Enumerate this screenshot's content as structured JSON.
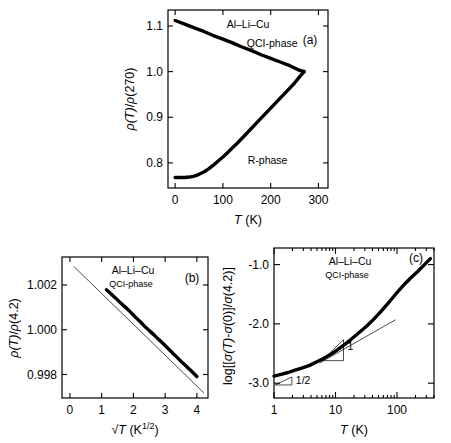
{
  "figure": {
    "name": "resistivity-and-conductivity-of-Al-Li-Cu-quasicrystal",
    "background": "#ffffff",
    "ink_color": "#000000"
  },
  "chart_data": [
    {
      "id": "panel-a",
      "type": "line",
      "panel_label": "(a)",
      "title": "Al–Li–Cu",
      "xlabel": "T (K)",
      "ylabel": "ρ(T)/ρ(270)",
      "xlim": [
        -15,
        320
      ],
      "ylim": [
        0.745,
        1.135
      ],
      "xticks": [
        0,
        100,
        200,
        300
      ],
      "xtick_labels": [
        "0",
        "100",
        "200",
        "300"
      ],
      "yticks": [
        0.8,
        0.9,
        1.0,
        1.1
      ],
      "ytick_labels": [
        "0.8",
        "0.9",
        "1.0",
        "1.1"
      ],
      "grid": false,
      "legend": "inline-annotations",
      "annotations": [
        {
          "text": "QCI-phase",
          "x": 150,
          "y": 1.055
        },
        {
          "text": "R-phase",
          "x": 152,
          "y": 0.797
        }
      ],
      "series": [
        {
          "name": "QCI-phase",
          "x": [
            0,
            20,
            40,
            60,
            80,
            100,
            120,
            140,
            160,
            180,
            200,
            220,
            240,
            260,
            270
          ],
          "y": [
            1.112,
            1.104,
            1.096,
            1.088,
            1.079,
            1.071,
            1.063,
            1.054,
            1.046,
            1.037,
            1.029,
            1.021,
            1.013,
            1.003,
            1.0
          ]
        },
        {
          "name": "R-phase",
          "x": [
            0,
            10,
            20,
            30,
            40,
            50,
            60,
            70,
            80,
            90,
            100,
            110,
            120,
            130,
            140,
            150,
            160,
            170,
            180,
            190,
            200,
            210,
            220,
            230,
            240,
            250,
            260,
            270
          ],
          "y": [
            0.768,
            0.768,
            0.768,
            0.769,
            0.771,
            0.775,
            0.78,
            0.787,
            0.795,
            0.804,
            0.813,
            0.823,
            0.833,
            0.843,
            0.854,
            0.865,
            0.876,
            0.887,
            0.898,
            0.909,
            0.92,
            0.931,
            0.942,
            0.953,
            0.964,
            0.975,
            0.988,
            1.0
          ]
        }
      ]
    },
    {
      "id": "panel-b",
      "type": "scatter",
      "panel_label": "(b)",
      "title": "Al–Li–Cu",
      "subtitle": "QCI-phase",
      "xlabel": "√T (K^1/2)",
      "xlabel_parts": {
        "root": "√T",
        "unit": "(K",
        "exponent": "1/2",
        "close": ")"
      },
      "ylabel": "ρ(T)/ρ(4.2)",
      "xlim": [
        -0.25,
        4.35
      ],
      "ylim": [
        0.99695,
        1.00325
      ],
      "xticks": [
        0,
        1,
        2,
        3,
        4
      ],
      "xtick_labels": [
        "0",
        "1",
        "2",
        "3",
        "4"
      ],
      "yticks": [
        0.998,
        1.0,
        1.002
      ],
      "ytick_labels": [
        "0.998",
        "1.000",
        "1.002"
      ],
      "grid": false,
      "fit_line": {
        "name": "linear-fit",
        "x": [
          0.12,
          4.22
        ],
        "y": [
          1.00283,
          0.99718
        ]
      },
      "series": [
        {
          "name": "QCI-phase-data",
          "x": [
            1.15,
            1.3,
            1.45,
            1.6,
            1.75,
            1.9,
            2.05,
            2.2,
            2.35,
            2.5,
            2.65,
            2.8,
            2.95,
            3.1,
            3.25,
            3.4,
            3.55,
            3.7,
            3.85,
            4.0
          ],
          "y": [
            1.00179,
            1.0016,
            1.0014,
            1.00119,
            1.001,
            1.0008,
            1.00058,
            1.00038,
            1.00016,
            0.99996,
            0.99977,
            0.99956,
            0.99936,
            0.99915,
            0.99894,
            0.99873,
            0.99852,
            0.99832,
            0.99812,
            0.99791
          ]
        }
      ]
    },
    {
      "id": "panel-c",
      "type": "line",
      "panel_label": "(c)",
      "title": "Al–Li–Cu",
      "subtitle": "QCI-phase",
      "xlabel": "T (K)",
      "ylabel": "log[[σ(T)-σ(0)]/σ(4.2)]",
      "xscale": "log",
      "xlim": [
        1,
        400
      ],
      "ylim": [
        -3.25,
        -0.72
      ],
      "xticks": [
        1,
        10,
        100
      ],
      "xtick_labels": [
        "1",
        "10",
        "100"
      ],
      "yticks": [
        -3.0,
        -2.0,
        -1.0
      ],
      "ytick_labels": [
        "-3.0",
        "-2.0",
        "-1.0"
      ],
      "grid": false,
      "slope_markers": [
        {
          "label": "1/2",
          "slope": 0.5,
          "x_start": 1.05,
          "x_end": 1.95,
          "y_start": -3.03
        },
        {
          "label": "1",
          "slope": 1.0,
          "x_start": 6.0,
          "x_end": 13.5,
          "y_start": -2.62
        }
      ],
      "guide_lines": [
        {
          "name": "slope-one-guide",
          "x": [
            5.5,
            95
          ],
          "y": [
            -2.66,
            -1.93
          ]
        }
      ],
      "series": [
        {
          "name": "QCI-phase-data",
          "x": [
            1.0,
            1.3,
            1.7,
            2.2,
            2.9,
            3.8,
            5.0,
            6.5,
            8.5,
            11,
            14,
            18,
            24,
            32,
            42,
            55,
            72,
            95,
            125,
            165,
            215,
            280,
            350
          ],
          "y": [
            -2.88,
            -2.85,
            -2.82,
            -2.78,
            -2.74,
            -2.7,
            -2.64,
            -2.58,
            -2.51,
            -2.43,
            -2.35,
            -2.26,
            -2.15,
            -2.04,
            -1.92,
            -1.79,
            -1.65,
            -1.5,
            -1.36,
            -1.23,
            -1.12,
            -1.0,
            -0.9
          ]
        }
      ]
    }
  ]
}
